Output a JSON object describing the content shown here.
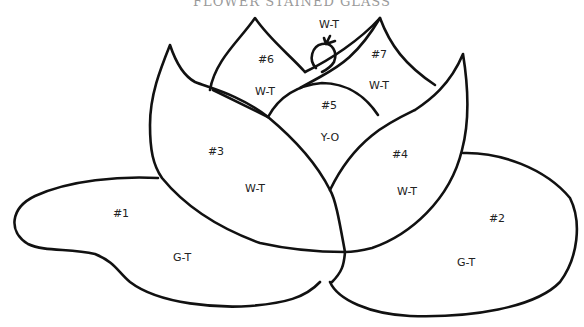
{
  "title": "FLOWER STAINED GLASS",
  "colors": {
    "line": "#111111",
    "background": "#ffffff",
    "label": "#222222"
  },
  "pieces": [
    {
      "id": "1",
      "number_label": "#1",
      "glass_code": "G-T",
      "name": "left-leaf"
    },
    {
      "id": "2",
      "number_label": "#2",
      "glass_code": "G-T",
      "name": "right-leaf"
    },
    {
      "id": "3",
      "number_label": "#3",
      "glass_code": "W-T",
      "name": "left-front-petal"
    },
    {
      "id": "4",
      "number_label": "#4",
      "glass_code": "W-T",
      "name": "right-front-petal"
    },
    {
      "id": "5",
      "number_label": "#5",
      "glass_code": "Y-O",
      "name": "center"
    },
    {
      "id": "6",
      "number_label": "#6",
      "glass_code": "W-T",
      "name": "left-back-petal"
    },
    {
      "id": "7",
      "number_label": "#7",
      "glass_code": "W-T",
      "name": "right-back-petal"
    },
    {
      "id": "bud",
      "number_label": "",
      "glass_code": "W-T",
      "name": "top-bud"
    }
  ]
}
